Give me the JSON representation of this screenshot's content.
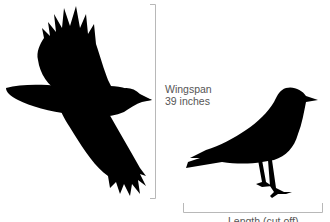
{
  "figure": {
    "type": "size comparison diagram",
    "subjects": [
      {
        "name": "flying-crow",
        "icon": "crow-flying-silhouette"
      },
      {
        "name": "standing-crow",
        "icon": "crow-standing-silhouette"
      }
    ],
    "wingspan": {
      "label": "Wingspan",
      "value": "39 inches"
    },
    "length": {
      "label": "Length (cut off)"
    },
    "colors": {
      "silhouette": "#000000",
      "bracket": "#b8b8b8",
      "text": "#555555",
      "background": "#ffffff"
    }
  }
}
